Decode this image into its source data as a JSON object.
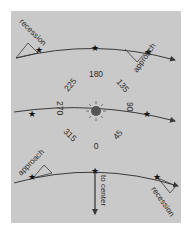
{
  "diagram": {
    "background_color": "#c9c9c9",
    "line_color": "#3a3a3a",
    "sun_color": "#555555",
    "labels": {
      "top_left": "recession",
      "top_right": "approach",
      "bottom_left": "approach",
      "bottom_right": "recession",
      "to_center": "to center"
    },
    "angles": [
      "180",
      "135",
      "90",
      "45",
      "0",
      "315",
      "270",
      "225"
    ]
  }
}
